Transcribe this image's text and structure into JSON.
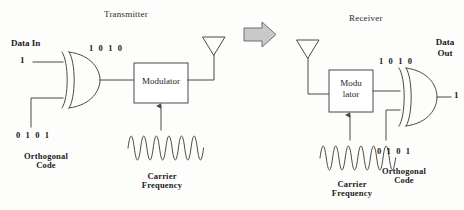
{
  "figure": {
    "title_transmitter": "Transmitter",
    "title_receiver": "Receiver"
  },
  "transmitter": {
    "data_in_label": "Data In",
    "data_in_value": "1",
    "xor_gate_name": "XOR",
    "encoded_bits": "1 0 1 0",
    "modulator_label": "Modulator",
    "orthogonal_code_bits": "0 1 0 1",
    "orthogonal_code_label": "Orthogonal\nCode",
    "carrier_label": "Carrier\nFrequency",
    "antenna_name": "transmit-antenna"
  },
  "link": {
    "arrow_name": "channel-arrow",
    "arrow_fill": "#c9c9c9",
    "arrow_stroke": "#6e6e6e"
  },
  "receiver": {
    "antenna_name": "receive-antenna",
    "demodulator_label": "Modu\nlator",
    "demodulator_line1": "Modu",
    "demodulator_line2": "lator",
    "recovered_bits": "1 0 1 0",
    "orthogonal_code_bits": "0 1 0 1",
    "orthogonal_code_label": "Orthogonal\nCode",
    "carrier_label": "Carrier\nFrequency",
    "data_out_label": "Data\nOut",
    "data_out_line1": "Data",
    "data_out_line2": "Out",
    "data_out_value": "1",
    "xor_gate_name": "XOR"
  },
  "colors": {
    "line": "#4a4a4a",
    "text": "#1a1a1a",
    "background": "#fdfdfb"
  }
}
